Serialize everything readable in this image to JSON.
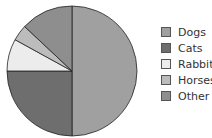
{
  "chart_data": {
    "type": "pie",
    "title": "",
    "categories": [
      "Dogs",
      "Cats",
      "Rabbits",
      "Horses",
      "Other"
    ],
    "values": [
      50,
      25,
      8,
      4,
      13
    ],
    "colors": [
      "#a0a0a0",
      "#6e6e6e",
      "#ececec",
      "#bcbcbc",
      "#8e8e8e"
    ],
    "start_angle_deg": 90,
    "direction": "clockwise",
    "legend_position": "right"
  },
  "legend": {
    "items": [
      {
        "label": "Dogs",
        "color": "#a0a0a0"
      },
      {
        "label": "Cats",
        "color": "#6e6e6e"
      },
      {
        "label": "Rabbits",
        "color": "#ececec"
      },
      {
        "label": "Horses",
        "color": "#bcbcbc"
      },
      {
        "label": "Other",
        "color": "#8e8e8e"
      }
    ]
  }
}
